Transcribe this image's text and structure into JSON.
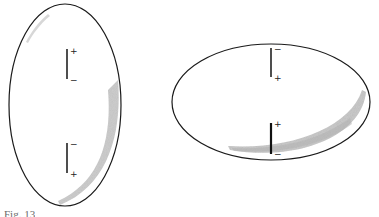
{
  "figure": {
    "panels": [
      {
        "id": "vertical-ellipse",
        "shape": "ellipse",
        "orientation": "vertical",
        "dipoles": [
          {
            "position": "upper",
            "top_sign": "+",
            "bottom_sign": "−"
          },
          {
            "position": "lower",
            "top_sign": "−",
            "bottom_sign": "+"
          }
        ],
        "shading": "crescent along right-lower inner edge, faint streak at upper-left"
      },
      {
        "id": "horizontal-ellipse",
        "shape": "ellipse",
        "orientation": "horizontal",
        "dipoles": [
          {
            "position": "upper",
            "top_sign": "−",
            "bottom_sign": "+"
          },
          {
            "position": "lower",
            "top_sign": "+",
            "bottom_sign": "−"
          }
        ],
        "shading": "crescent along lower-right inner edge"
      }
    ],
    "colors": {
      "outline": "#1a1a1a",
      "shading": "#bdbdbd",
      "background": "#ffffff"
    }
  },
  "caption": {
    "text": "Fig. 13"
  },
  "labels": {
    "left_upper_top": "+",
    "left_upper_bottom": "−",
    "left_lower_top": "−",
    "left_lower_bottom": "+",
    "right_upper_top": "−",
    "right_upper_bottom": "+",
    "right_lower_top": "+",
    "right_lower_bottom": "−"
  }
}
